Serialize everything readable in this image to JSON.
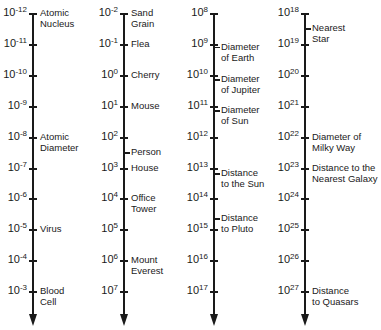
{
  "layout": {
    "top_y": 14,
    "tick_spacing": 30.9,
    "axis_x": [
      33,
      124,
      214,
      305
    ]
  },
  "scales": [
    {
      "exponents": [
        "-12",
        "-11",
        "-10",
        "-9",
        "-8",
        "-7",
        "-6",
        "-5",
        "-4",
        "-3"
      ],
      "labels": [
        {
          "index": 0,
          "offset": 0,
          "lines": [
            "Atomic",
            "Nucleus"
          ]
        },
        {
          "index": 4,
          "offset": 0,
          "lines": [
            "Atomic",
            "Diameter"
          ]
        },
        {
          "index": 7,
          "offset": 0,
          "lines": [
            "Virus"
          ]
        },
        {
          "index": 9,
          "offset": 0,
          "lines": [
            "Blood",
            "Cell"
          ]
        }
      ]
    },
    {
      "exponents": [
        "-2",
        "-1",
        "0",
        "1",
        "2",
        "3",
        "4",
        "5",
        "6",
        "7"
      ],
      "labels": [
        {
          "index": 0,
          "offset": 0,
          "lines": [
            "Sand",
            "Grain"
          ]
        },
        {
          "index": 1,
          "offset": 0,
          "lines": [
            "Flea"
          ]
        },
        {
          "index": 2,
          "offset": 0,
          "lines": [
            "Cherry"
          ]
        },
        {
          "index": 3,
          "offset": 0,
          "lines": [
            "Mouse"
          ]
        },
        {
          "index": 4,
          "offset": 0.5,
          "lines": [
            "Person"
          ]
        },
        {
          "index": 5,
          "offset": 0,
          "lines": [
            "House"
          ]
        },
        {
          "index": 6,
          "offset": 0,
          "lines": [
            "Office",
            "Tower"
          ]
        },
        {
          "index": 8,
          "offset": 0,
          "lines": [
            "Mount",
            "Everest"
          ]
        }
      ]
    },
    {
      "exponents": [
        "8",
        "9",
        "10",
        "11",
        "12",
        "13",
        "14",
        "15",
        "16",
        "17"
      ],
      "labels": [
        {
          "index": 1,
          "offset": 0.1,
          "lines": [
            "Diameter",
            "of Earth"
          ]
        },
        {
          "index": 2,
          "offset": 0.15,
          "lines": [
            "Diameter",
            "of Jupiter"
          ]
        },
        {
          "index": 3,
          "offset": 0.15,
          "lines": [
            "Diameter",
            "of Sun"
          ]
        },
        {
          "index": 5,
          "offset": 0.18,
          "lines": [
            "Distance",
            "to the Sun"
          ]
        },
        {
          "index": 6,
          "offset": 0.65,
          "lines": [
            "Distance",
            "to Pluto"
          ]
        }
      ]
    },
    {
      "exponents": [
        "18",
        "19",
        "20",
        "21",
        "22",
        "23",
        "24",
        "25",
        "26",
        "27"
      ],
      "labels": [
        {
          "index": 0,
          "offset": 0.5,
          "lines": [
            "Nearest",
            "Star"
          ]
        },
        {
          "index": 4,
          "offset": 0,
          "lines": [
            "Diameter of",
            "Milky Way"
          ]
        },
        {
          "index": 5,
          "offset": 0,
          "lines": [
            "Distance to the",
            "Nearest Galaxy"
          ]
        },
        {
          "index": 9,
          "offset": 0,
          "lines": [
            "Distance",
            "to Quasars"
          ]
        }
      ]
    }
  ],
  "base": "10"
}
